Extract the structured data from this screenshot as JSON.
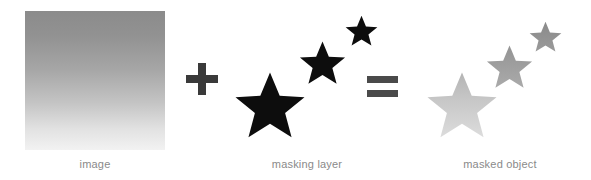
{
  "diagram": {
    "background_color": "#ffffff",
    "caption_color": "#8a8a8a",
    "panels": [
      {
        "id": "image",
        "label": "image",
        "kind": "gradient-square",
        "gradient_from": "#8b8b8b",
        "gradient_to": "#f2f2f2",
        "gradient_direction": "top-to-bottom"
      },
      {
        "id": "masking-layer",
        "label": "masking layer",
        "kind": "star-group",
        "fill": "#0d0d0d",
        "stars": [
          {
            "name": "large-star",
            "size": 72
          },
          {
            "name": "medium-star",
            "size": 48
          },
          {
            "name": "small-star",
            "size": 34
          }
        ]
      },
      {
        "id": "masked-object",
        "label": "masked object",
        "kind": "star-group-masked",
        "stars": [
          {
            "name": "large-star",
            "size": 72,
            "fill": "#c9c9c9"
          },
          {
            "name": "medium-star",
            "size": 48,
            "fill": "#9e9e9e"
          },
          {
            "name": "small-star",
            "size": 34,
            "fill": "#8f8f8f"
          }
        ]
      }
    ],
    "operators": [
      {
        "id": "plus",
        "symbol": "+",
        "color": "#3a3a3a"
      },
      {
        "id": "equals",
        "symbol": "=",
        "color": "#4a4a4a"
      }
    ]
  }
}
